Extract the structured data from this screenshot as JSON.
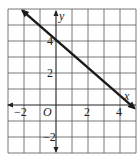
{
  "chart_data": {
    "type": "line",
    "title": "",
    "xlabel": "x",
    "ylabel": "y",
    "origin_label": "O",
    "xlim": [
      -3,
      5
    ],
    "ylim": [
      -3,
      6
    ],
    "grid": true,
    "x_tick_labels": [
      {
        "value": -2,
        "label": "−2"
      },
      {
        "value": 2,
        "label": "2"
      },
      {
        "value": 4,
        "label": "4"
      }
    ],
    "y_tick_labels": [
      {
        "value": 4,
        "label": "4"
      },
      {
        "value": 2,
        "label": "2"
      },
      {
        "value": -2,
        "label": "−2"
      }
    ],
    "series": [
      {
        "name": "line",
        "x": [
          -2.1,
          0,
          4.9
        ],
        "y": [
          5.9,
          4,
          -0.2
        ],
        "arrows": "both",
        "y_intercept": 4,
        "x_intercept_approx": 4.6,
        "slope_approx": -0.875
      }
    ]
  },
  "colors": {
    "grid": "#555555",
    "axis": "#222222",
    "line": "#1a1a1a",
    "background": "#ffffff"
  }
}
